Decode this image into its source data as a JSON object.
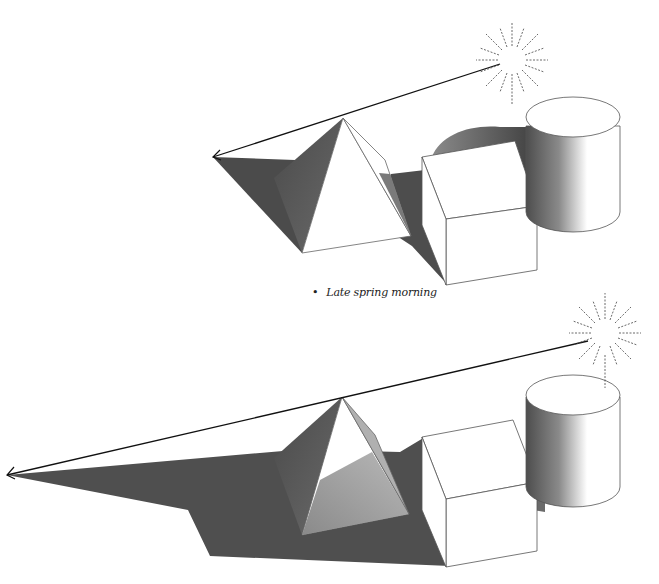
{
  "figure": {
    "caption_label": "Late spring morning",
    "caption_bullet": "•"
  },
  "scenes": [
    {
      "id": "top",
      "sun": {
        "cx": 512,
        "cy": 60
      },
      "light_ray": {
        "from": [
          512,
          60
        ],
        "to": [
          213,
          157
        ]
      },
      "objects": [
        "pyramid",
        "cube",
        "cylinder"
      ],
      "shadow_color": "#4a4a4a"
    },
    {
      "id": "bottom",
      "sun": {
        "cx": 605,
        "cy": 333
      },
      "light_ray": {
        "from": [
          590,
          341
        ],
        "to": [
          7,
          475
        ]
      },
      "objects": [
        "pyramid",
        "cube",
        "cylinder"
      ],
      "shadow_color": "#4f4f4f"
    }
  ],
  "colors": {
    "shadow": "#4a4a4a",
    "pyramid_shaded_face": "#5a5a5a",
    "pyramid_lit_face": "#ffffff",
    "outline": "#555555",
    "ray": "#111111"
  }
}
